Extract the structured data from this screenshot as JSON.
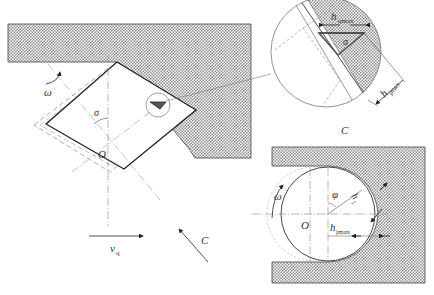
{
  "figure": {
    "type": "engineering-diagram",
    "colors": {
      "line": "#222222",
      "hatch": "#9a9a9a",
      "dashed": "#777777",
      "background": "#ffffff"
    }
  },
  "left_view": {
    "labels": {
      "omega": "ω",
      "sigma": "σ",
      "center": "O",
      "velocity": "v",
      "velocity_sub": "q",
      "direction": "C"
    }
  },
  "detail_view": {
    "title": "C",
    "labels": {
      "h_qmax": "h",
      "h_qmax_sub": "qmax",
      "sigma": "σ",
      "h_jmax": "h",
      "h_jmax_sub": "jmax"
    }
  },
  "right_view": {
    "labels": {
      "omega": "ω",
      "phi": "φ",
      "h_j": "h",
      "h_j_sub": "j",
      "center": "O",
      "h_jmax": "h",
      "h_jmax_sub": "jmax"
    }
  }
}
